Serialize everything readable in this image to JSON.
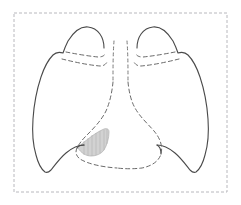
{
  "figure": {
    "title": "Anterior chest diagram of the lungs",
    "kind": "line-drawing",
    "width": 241,
    "height": 205,
    "background_color": "#ffffff"
  },
  "frame": {
    "name": "dashed-border-box",
    "stroke_color": "#b8b8bd",
    "stroke_width": 1,
    "dash_pattern": "3,2",
    "x": 14,
    "y": 13,
    "width": 213,
    "height": 179,
    "fill": "#ffffff"
  },
  "styles": {
    "outline_stroke": "#4a4a4a",
    "outline_width": 1.1,
    "fissure_stroke": "#6a6a6a",
    "fissure_width": 1.0,
    "fissure_dash": "4,3",
    "mediastinum_stroke": "#6a6a6a",
    "mediastinum_width": 1.0,
    "mediastinum_dash": "4,3",
    "trachea_stroke": "#7a7a7a",
    "trachea_width": 1.0,
    "trachea_dash": "3,3",
    "lesion_fill": "#d2d2d2",
    "lesion_stroke": "#b0b0b0",
    "hatch_stroke": "#b4b4b4"
  },
  "parts": {
    "left_lung_outline": {
      "label": "Left lung outline (viewer's left / patient's right lung)",
      "path": "M 104 48 C 104 37 98 28 88 27 C 79 26 73 33 68 41 C 66 45 64 50 63 53 C 60 52 56 52 53 55 C 48 60 44 68 41 77 C 37 89 34 104 33 119 C 32 133 33 145 36 155 C 38 163 41 169 45 172 C 47 173 49 172 51 170 C 55 165 60 158 66 153 C 72 148 78 145 84 145"
    },
    "right_lung_outline": {
      "label": "Right lung outline (viewer's right / patient's left lung)",
      "path": "M 137 48 C 137 37 143 28 153 27 C 162 26 168 33 173 41 C 175 45 177 50 178 53 C 181 52 185 52 188 55 C 193 60 197 68 200 77 C 204 89 207 104 208 119 C 209 133 208 145 205 155 C 203 163 200 169 196 172 C 194 173 192 172 190 170 C 186 165 181 158 175 153 C 169 148 163 145 157 145"
    },
    "left_upper_fissure": {
      "label": "Left horizontal fissure (upper dashed line)",
      "path": "M 66 52 C 76 54 88 56 98 57 C 102 57 104 56 105 54"
    },
    "left_lower_fissure": {
      "label": "Left oblique fissure (lower dashed line)",
      "path": "M 62 59 C 74 62 88 65 100 66 C 104 66 106 64 107 62"
    },
    "right_upper_fissure": {
      "label": "Right horizontal fissure (upper dashed line)",
      "path": "M 175 52 C 165 54 153 56 143 57 C 139 57 137 56 136 54"
    },
    "right_lower_fissure": {
      "label": "Right oblique fissure (lower dashed line)",
      "path": "M 179 59 C 167 62 153 65 141 66 C 137 66 135 64 134 62"
    },
    "trachea_line_left": {
      "label": "Trachea left wall (vertical dashed)",
      "path": "M 114 41 C 113 54 113 68 113 82"
    },
    "trachea_line_right": {
      "label": "Trachea right wall (vertical dashed)",
      "path": "M 127 41 C 128 54 128 68 128 82"
    },
    "mediastinum_left_border": {
      "label": "Left mediastinal / cardiac border (dashed)",
      "path": "M 113 82 C 112 92 110 102 106 111 C 101 121 93 129 86 136 C 82 140 79 144 77 148 C 75 152 76 156 80 159 C 88 164 102 167 117 168"
    },
    "mediastinum_right_border": {
      "label": "Right mediastinal / cardiac border (dashed)",
      "path": "M 128 82 C 129 92 131 101 135 108 C 140 117 148 124 154 131 C 160 138 163 146 161 154 C 159 161 152 166 142 168 C 134 169 125 169 117 168"
    },
    "left_costophrenic_junction": {
      "label": "Left costophrenic / diaphragm junction",
      "path": "M 84 145 C 81 145 78 146 77 148"
    },
    "right_costophrenic_junction": {
      "label": "Right costophrenic / diaphragm junction",
      "path": "M 157 145 C 159 146 161 149 161 154"
    },
    "lesion": {
      "label": "Shaded lesion / consolidation wedge (lingula region)",
      "fill_color": "#d2d2d2",
      "path": "M 78 148 C 80 145 84 142 88 139 C 93 135 99 131 104 129 C 107 128 109 129 109 132 C 109 138 107 145 104 150 C 101 154 96 156 91 156 C 86 156 81 153 78 148 Z",
      "hatch_lines": [
        "M 84 141 L 84 155",
        "M 88 138 L 88 156",
        "M 92 135 L 92 156",
        "M 96 133 L 96 155",
        "M 100 131 L 100 153",
        "M 104 130 L 104 150",
        "M 107 129 L 107 144"
      ]
    }
  },
  "annotations": {
    "visible_text": []
  }
}
